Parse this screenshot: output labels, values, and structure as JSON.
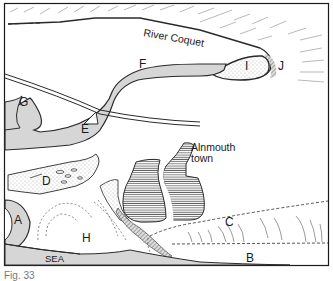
{
  "figure": {
    "caption": "Fig. 33",
    "frame": {
      "border_color": "#1a1a1a",
      "background": "#ffffff"
    }
  },
  "labels": {
    "river": "River Coquet",
    "town_line1": "Alnmouth",
    "town_line2": "town",
    "sea": "SEA",
    "A": "A",
    "B": "B",
    "C": "C",
    "D": "D",
    "E": "E",
    "F": "F",
    "G": "G",
    "H": "H",
    "I": "I",
    "J": "J"
  },
  "colors": {
    "water_fill": "#d6d6d6",
    "outline": "#2a2a2a",
    "hatch": "#555555",
    "town_fill": "#b8b8b8"
  }
}
